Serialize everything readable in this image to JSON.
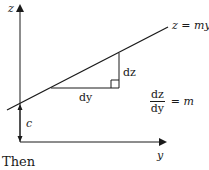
{
  "diagram": {
    "axis_labels": {
      "vertical": "z",
      "horizontal": "y"
    },
    "line_label": "z = my ·",
    "triangle": {
      "run_label": "dy",
      "rise_label": "dz"
    },
    "intercept_label": "c",
    "slope_equation": {
      "numerator": "dz",
      "denominator": "dy",
      "equals": "= m"
    },
    "colors": {
      "ink": "#1a1a1a",
      "background": "#ffffff"
    }
  },
  "caption": "Then"
}
